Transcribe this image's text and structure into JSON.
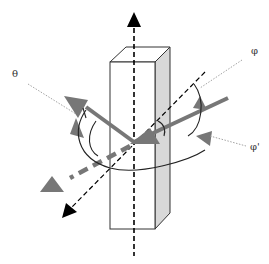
{
  "diagram": {
    "labels": {
      "theta": "θ",
      "phi": "φ",
      "phi_prime": "φ'"
    },
    "colors": {
      "axis": "#000000",
      "arrow_gray": "#777777",
      "box_side": "#d8d8d8",
      "box_edge": "#333333",
      "leader_dotted": "#999999"
    }
  }
}
